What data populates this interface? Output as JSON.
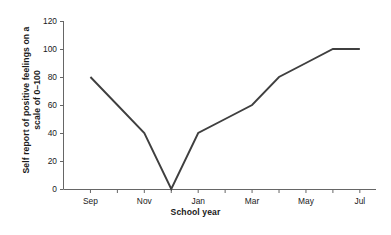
{
  "chart_data": {
    "type": "line",
    "title": "",
    "subtitle": "",
    "xlabel": "School year",
    "ylabel": "Self report of positive feelings on a scale of 0–100",
    "ylabel_line1": "Self report of positive feelings on a",
    "ylabel_line2": "scale of 0–100",
    "x_tick_labels": [
      "Sep",
      "Nov",
      "Jan",
      "Mar",
      "May",
      "Jul"
    ],
    "x_tick_months": [
      "Sep",
      "Oct",
      "Nov",
      "Dec",
      "Jan",
      "Feb",
      "Mar",
      "Apr",
      "May",
      "Jun",
      "Jul"
    ],
    "y_tick_labels": [
      "0",
      "20",
      "40",
      "60",
      "80",
      "100",
      "120"
    ],
    "y_tick_values": [
      0,
      20,
      40,
      60,
      80,
      100,
      120
    ],
    "ylim": [
      0,
      120
    ],
    "grid": false,
    "legend": false,
    "legend_position": "none",
    "series": [
      {
        "name": "Self report of positive feelings",
        "color": "#3f3f3f",
        "x": [
          "Sep",
          "Oct",
          "Nov",
          "Dec",
          "Jan",
          "Feb",
          "Mar",
          "Apr",
          "May",
          "Jun",
          "Jul"
        ],
        "values": [
          80,
          60,
          40,
          0,
          40,
          50,
          60,
          80,
          90,
          100,
          100
        ]
      }
    ],
    "categories": [
      "Sep",
      "Oct",
      "Nov",
      "Dec",
      "Jan",
      "Feb",
      "Mar",
      "Apr",
      "May",
      "Jun",
      "Jul"
    ],
    "values": [
      80,
      60,
      40,
      0,
      40,
      50,
      60,
      80,
      90,
      100,
      100
    ],
    "annotations": []
  },
  "axes": {
    "line_color": "#666666",
    "series_color": "#3f3f3f"
  }
}
